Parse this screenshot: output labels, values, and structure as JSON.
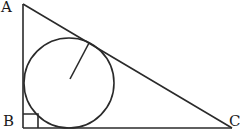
{
  "diagram": {
    "type": "right-triangle-with-inscribed-circle",
    "vertices": {
      "A": {
        "label": "A",
        "x": 23,
        "y": 4
      },
      "B": {
        "label": "B",
        "x": 23,
        "y": 128
      },
      "C": {
        "label": "C",
        "x": 232,
        "y": 128
      }
    },
    "incircle": {
      "cx": 69,
      "cy": 83,
      "r": 45
    },
    "radius_segment": {
      "x1": 70,
      "y1": 79,
      "x2": 89,
      "y2": 43
    },
    "right_angle_marker": {
      "at": "B",
      "size": 14
    },
    "stroke_color": "#2a2a2a"
  }
}
